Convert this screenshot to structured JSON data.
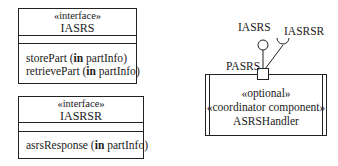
{
  "interfaces": [
    {
      "stereotype": "«interface»",
      "name": "IASRS",
      "operations": [
        {
          "name": "storePart",
          "direction": "in",
          "param": "partInfo"
        },
        {
          "name": "retrievePart",
          "direction": "in",
          "param": "partInfo"
        }
      ]
    },
    {
      "stereotype": "«interface»",
      "name": "IASRSR",
      "operations": [
        {
          "name": "asrsResponse",
          "direction": "in",
          "param": "partInfo"
        }
      ]
    }
  ],
  "component": {
    "stereotype_1": "«optional»",
    "stereotype_2": "«coordinator component»",
    "name": "ASRSHandler",
    "port": {
      "name": "PASRS"
    },
    "provided_interface": "IASRS",
    "required_interface": "IASRSR"
  },
  "colors": {
    "line": "#222222",
    "text": "#1a1a1a",
    "background": "#ffffff"
  }
}
